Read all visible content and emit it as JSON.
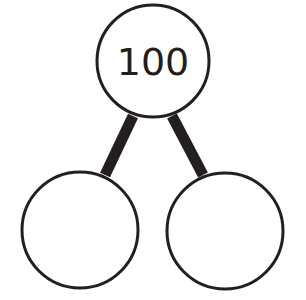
{
  "diagram": {
    "type": "number-bond",
    "whole": {
      "value": "100"
    },
    "parts": [
      {
        "value": ""
      },
      {
        "value": ""
      }
    ],
    "colors": {
      "stroke": "#231f20",
      "fill": "#ffffff"
    }
  }
}
